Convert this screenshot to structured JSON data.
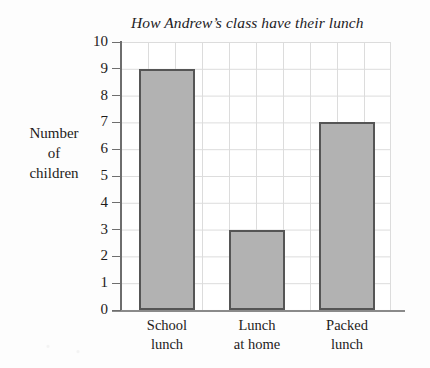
{
  "chart_data": {
    "type": "bar",
    "title": "How Andrew’s class have their lunch",
    "xlabel": "",
    "ylabel": "Number of children",
    "ylabel_lines": [
      "Number",
      "of",
      "children"
    ],
    "categories": [
      "School lunch",
      "Lunch at home",
      "Packed lunch"
    ],
    "category_lines": [
      [
        "School",
        "lunch"
      ],
      [
        "Lunch",
        "at home"
      ],
      [
        "Packed",
        "lunch"
      ]
    ],
    "values": [
      9,
      3,
      7
    ],
    "ylim": [
      0,
      10
    ],
    "ytick_labels": [
      "0",
      "1",
      "2",
      "3",
      "4",
      "5",
      "6",
      "7",
      "8",
      "9",
      "10"
    ],
    "ytick_values": [
      0,
      1,
      2,
      3,
      4,
      5,
      6,
      7,
      8,
      9,
      10
    ],
    "grid": true,
    "legend": false,
    "colors": {
      "bar_fill": "#b2b2b2",
      "bar_outline": "#555555",
      "grid_line": "#dcdcdc",
      "axis_line": "#6e6e6e",
      "background": "#fdfdfd",
      "plot_background": "#ffffff",
      "text": "#1d1b1a"
    }
  }
}
